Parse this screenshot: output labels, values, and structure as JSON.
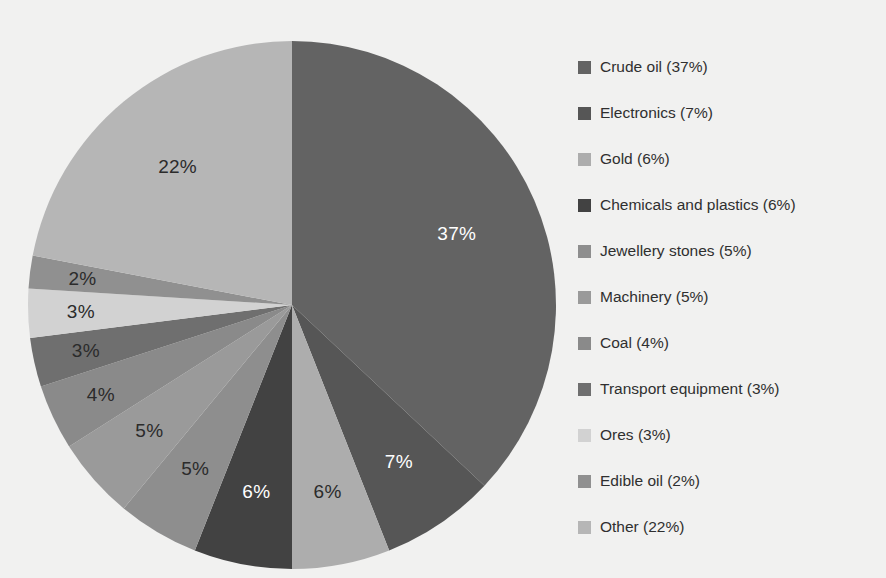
{
  "chart_data": {
    "type": "pie",
    "title": "",
    "subtitle": "",
    "xlabel": "",
    "ylabel": "",
    "legend_position": "right",
    "grid": false,
    "start_angle_deg": 0,
    "direction": "clockwise",
    "categories": [
      "Crude oil",
      "Electronics",
      "Gold",
      "Chemicals and plastics",
      "Jewellery stones",
      "Machinery",
      "Coal",
      "Transport equipment",
      "Ores",
      "Edible oil",
      "Other"
    ],
    "values": [
      37,
      7,
      6,
      6,
      5,
      5,
      4,
      3,
      3,
      2,
      22
    ],
    "value_unit": "%",
    "slice_labels": [
      "37%",
      "7%",
      "6%",
      "6%",
      "5%",
      "5%",
      "4%",
      "3%",
      "3%",
      "2%",
      "22%"
    ],
    "slice_label_colors": [
      "#ffffff",
      "#ffffff",
      "#2b2b2b",
      "#ffffff",
      "#2b2b2b",
      "#2b2b2b",
      "#2b2b2b",
      "#2b2b2b",
      "#2b2b2b",
      "#2b2b2b",
      "#2b2b2b"
    ],
    "colors": [
      "#636363",
      "#565656",
      "#adadad",
      "#424242",
      "#8e8e8e",
      "#9a9a9a",
      "#8a8a8a",
      "#6f6f6f",
      "#d2d2d2",
      "#909090",
      "#b6b6b6"
    ],
    "legend": [
      {
        "label": "Crude oil (37%)",
        "name": "Crude oil",
        "value": 37,
        "color": "#636363"
      },
      {
        "label": "Electronics (7%)",
        "name": "Electronics",
        "value": 7,
        "color": "#565656"
      },
      {
        "label": "Gold (6%)",
        "name": "Gold",
        "value": 6,
        "color": "#adadad"
      },
      {
        "label": "Chemicals and plastics (6%)",
        "name": "Chemicals and plastics",
        "value": 6,
        "color": "#424242"
      },
      {
        "label": "Jewellery stones (5%)",
        "name": "Jewellery stones",
        "value": 5,
        "color": "#8e8e8e"
      },
      {
        "label": "Machinery (5%)",
        "name": "Machinery",
        "value": 5,
        "color": "#9a9a9a"
      },
      {
        "label": "Coal (4%)",
        "name": "Coal",
        "value": 4,
        "color": "#8a8a8a"
      },
      {
        "label": "Transport equipment (3%)",
        "name": "Transport equipment",
        "value": 3,
        "color": "#6f6f6f"
      },
      {
        "label": "Ores (3%)",
        "name": "Ores",
        "value": 3,
        "color": "#d2d2d2"
      },
      {
        "label": "Edible oil (2%)",
        "name": "Edible oil",
        "value": 2,
        "color": "#909090"
      },
      {
        "label": "Other (22%)",
        "name": "Other",
        "value": 22,
        "color": "#b6b6b6"
      }
    ],
    "geometry": {
      "center_x": 292,
      "center_y": 305,
      "radius": 264,
      "label_radius_ratio": 0.72
    },
    "background_color": "#f1f1f0"
  }
}
